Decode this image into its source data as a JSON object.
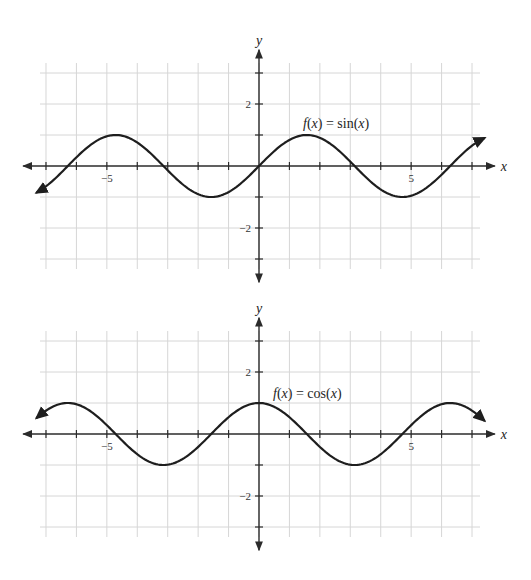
{
  "chart_data": [
    {
      "type": "line",
      "title": "",
      "function_label": "f(x) = sin(x)",
      "function_label_parts": [
        "f",
        "(",
        "x",
        ") = sin(",
        "x",
        ")"
      ],
      "xlabel": "x",
      "ylabel": "y",
      "xlim": [
        -7.5,
        7.5
      ],
      "ylim": [
        -3.5,
        3.5
      ],
      "grid": true,
      "x_tick_labels": [
        {
          "value": -5,
          "label": "−5"
        },
        {
          "value": 5,
          "label": "5"
        }
      ],
      "y_tick_labels": [
        {
          "value": 2,
          "label": "2"
        },
        {
          "value": -2,
          "label": "−2"
        }
      ],
      "x_ticks": [
        -7,
        -6,
        -5,
        -4,
        -3,
        -2,
        -1,
        1,
        2,
        3,
        4,
        5,
        6,
        7
      ],
      "y_ticks": [
        -3,
        -2,
        -1,
        1,
        2,
        3
      ],
      "curve_domain": [
        -7.3,
        7.4
      ],
      "series": [
        {
          "name": "f(x) = sin(x)",
          "x": [
            -7.3,
            -6.28,
            -4.71,
            -3.14,
            -1.57,
            0,
            1.57,
            3.14,
            4.71,
            6.28,
            7.4
          ],
          "values": [
            -0.85,
            0,
            1,
            0,
            -1,
            0,
            1,
            0,
            -1,
            0,
            0.9
          ]
        }
      ]
    },
    {
      "type": "line",
      "title": "",
      "function_label": "f(x) = cos(x)",
      "function_label_parts": [
        "f",
        "(",
        "x",
        ") = cos(",
        "x",
        ")"
      ],
      "xlabel": "x",
      "ylabel": "y",
      "xlim": [
        -7.5,
        7.5
      ],
      "ylim": [
        -3.5,
        3.5
      ],
      "grid": true,
      "x_tick_labels": [
        {
          "value": -5,
          "label": "−5"
        },
        {
          "value": 5,
          "label": "5"
        }
      ],
      "y_tick_labels": [
        {
          "value": 2,
          "label": "2"
        },
        {
          "value": -2,
          "label": "−2"
        }
      ],
      "x_ticks": [
        -7,
        -6,
        -5,
        -4,
        -3,
        -2,
        -1,
        1,
        2,
        3,
        4,
        5,
        6,
        7
      ],
      "y_ticks": [
        -3,
        -2,
        -1,
        1,
        2,
        3
      ],
      "curve_domain": [
        -7.3,
        7.4
      ],
      "series": [
        {
          "name": "f(x) = cos(x)",
          "x": [
            -7.3,
            -6.28,
            -4.71,
            -3.14,
            -1.57,
            0,
            1.57,
            3.14,
            4.71,
            6.28,
            7.4
          ],
          "values": [
            0.52,
            1,
            0,
            -1,
            0,
            1,
            0,
            -1,
            0,
            1,
            0.44
          ]
        }
      ]
    }
  ],
  "layout": {
    "px_per_unit_x": 30.43,
    "px_per_unit_y": 31.0,
    "origin_x": 259,
    "origins_y": [
      166,
      434
    ],
    "grid_color": "#d6d6d6",
    "axis_color": "#2b2b2b",
    "curve_color": "#1e1e1e"
  }
}
